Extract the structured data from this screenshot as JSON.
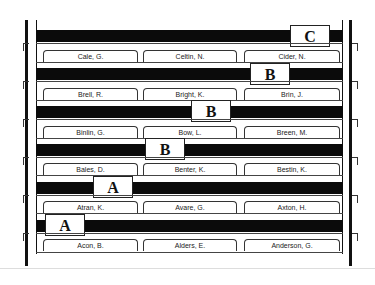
{
  "diagram": {
    "rows": [
      {
        "guide_letter": "C",
        "folders": [
          "Cale, G.",
          "Celtin, N.",
          "Cider, N."
        ]
      },
      {
        "guide_letter": "B",
        "folders": [
          "Brell, R.",
          "Bright, K.",
          "Brin, J."
        ]
      },
      {
        "guide_letter": "B",
        "folders": [
          "Binlin, G.",
          "Bow, L.",
          "Breen, M."
        ]
      },
      {
        "guide_letter": "B",
        "folders": [
          "Bales, D.",
          "Benter, K.",
          "Bestin, K."
        ]
      },
      {
        "guide_letter": "A",
        "folders": [
          "Atran, K.",
          "Avare, G.",
          "Axton, H."
        ]
      },
      {
        "guide_letter": "A",
        "folders": [
          "Acon, B.",
          "Alders, E.",
          "Anderson, G."
        ]
      }
    ]
  }
}
